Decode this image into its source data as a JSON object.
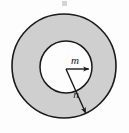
{
  "figure": {
    "kind": "annulus-diagram",
    "title": "",
    "background_color": "#fdfdfd",
    "ring_fill_color": "#cfcfcf",
    "inner_fill_color": "#fdfdfd",
    "stroke_color": "#1a1a1a",
    "outer_circle": {
      "name": "outer-circle",
      "center_x": 64,
      "center_y": 66,
      "radius": 52,
      "stroke_width": 1.6
    },
    "inner_circle": {
      "name": "inner-circle",
      "center_x": 66,
      "center_y": 67,
      "radius": 26,
      "stroke_width": 1.5
    },
    "radii": [
      {
        "id": "m",
        "label": "m",
        "from_x": 66,
        "from_y": 69,
        "to_x": 92,
        "to_y": 69,
        "label_x": 75,
        "label_y": 64,
        "describes": "inner radius vector",
        "stroke_width": 1.4
      },
      {
        "id": "n",
        "label": "n",
        "from_x": 66,
        "from_y": 69,
        "to_x": 87,
        "to_y": 116,
        "label_x": 76,
        "label_y": 98,
        "describes": "outer radius vector",
        "stroke_width": 1.4
      }
    ],
    "artifacts": [
      {
        "name": "scan-speck-top",
        "x": 62,
        "y": 1,
        "width": 5,
        "height": 5,
        "color": "#b4b4b4"
      }
    ]
  }
}
